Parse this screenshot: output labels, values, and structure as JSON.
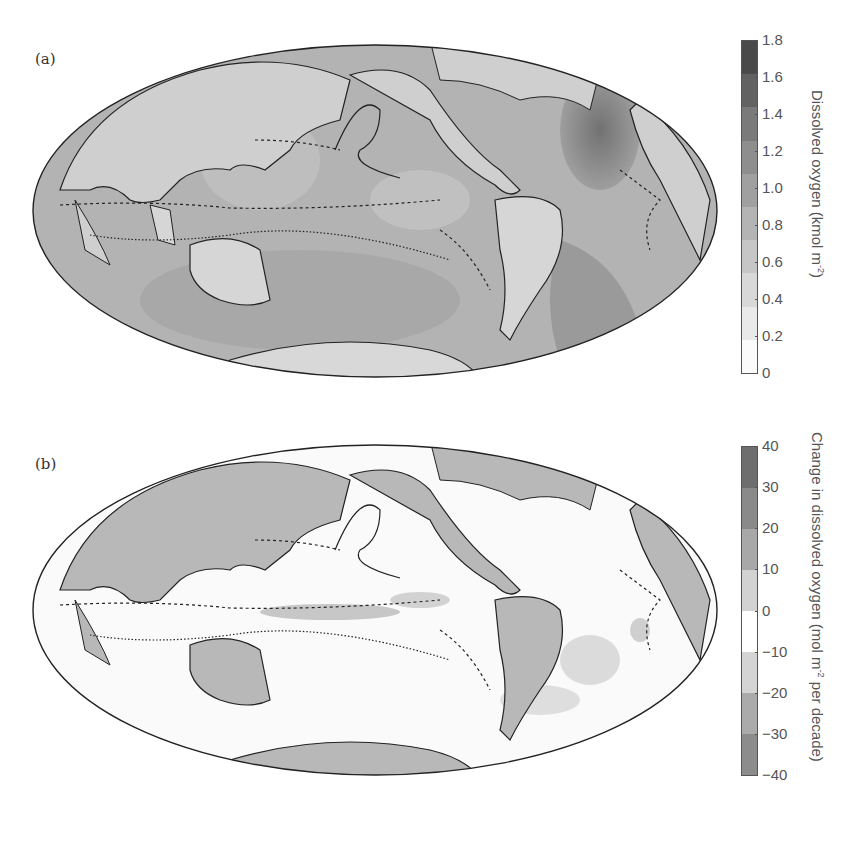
{
  "figure": {
    "panels": [
      {
        "label": "(a)",
        "colorbar": {
          "title_main": "Dissolved oxygen (kmol m",
          "title_sup": "-2",
          "title_end": ")",
          "ticks": [
            "1.8",
            "1.6",
            "1.4",
            "1.2",
            "1.0",
            "0.8",
            "0.6",
            "0.4",
            "0.2",
            "0"
          ],
          "colors_top_to_bottom": [
            "#4a4a4a",
            "#626262",
            "#7a7a7a",
            "#8e8e8e",
            "#a0a0a0",
            "#b4b4b4",
            "#c6c6c6",
            "#d8d8d8",
            "#e9e9e9",
            "#fbfbfb"
          ]
        }
      },
      {
        "label": "(b)",
        "colorbar": {
          "title_main": "Change in dissolved oxygen (mol m",
          "title_sup": "-2",
          "title_end": " per decade)",
          "ticks": [
            "40",
            "30",
            "20",
            "10",
            "0",
            "−10",
            "−20",
            "−30",
            "−40"
          ],
          "colors_top_to_bottom": [
            "#6e6e6e",
            "#8a8a8a",
            "#a8a8a8",
            "#d2d2d2",
            "#ffffff",
            "#d4d4d4",
            "#ababab",
            "#8c8c8c"
          ]
        }
      }
    ]
  },
  "chart_data": [
    {
      "type": "heatmap",
      "title": "(a)",
      "projection": "Hammer/Mollweide global map (Pacific-centred)",
      "colorbar_label": "Dissolved oxygen (kmol m^-2)",
      "colorbar_ticks": [
        0,
        0.2,
        0.4,
        0.6,
        0.8,
        1.0,
        1.2,
        1.4,
        1.6,
        1.8
      ],
      "vrange": [
        0,
        1.8
      ],
      "annotations": [
        "Dashed/dotted contours outlining tropical oxygen minimum zones",
        "Highest values in North Atlantic (~1.6)"
      ]
    },
    {
      "type": "heatmap",
      "title": "(b)",
      "projection": "Hammer/Mollweide global map (Pacific-centred)",
      "colorbar_label": "Change in dissolved oxygen (mol m^-2 per decade)",
      "colorbar_ticks": [
        -40,
        -30,
        -20,
        -10,
        0,
        10,
        20,
        30,
        40
      ],
      "vrange": [
        -40,
        40
      ],
      "annotations": [
        "Land shaded grey",
        "Mostly near-zero change; negative patches in equatorial Pacific, S. Atlantic, S. Indian Ocean"
      ]
    }
  ]
}
